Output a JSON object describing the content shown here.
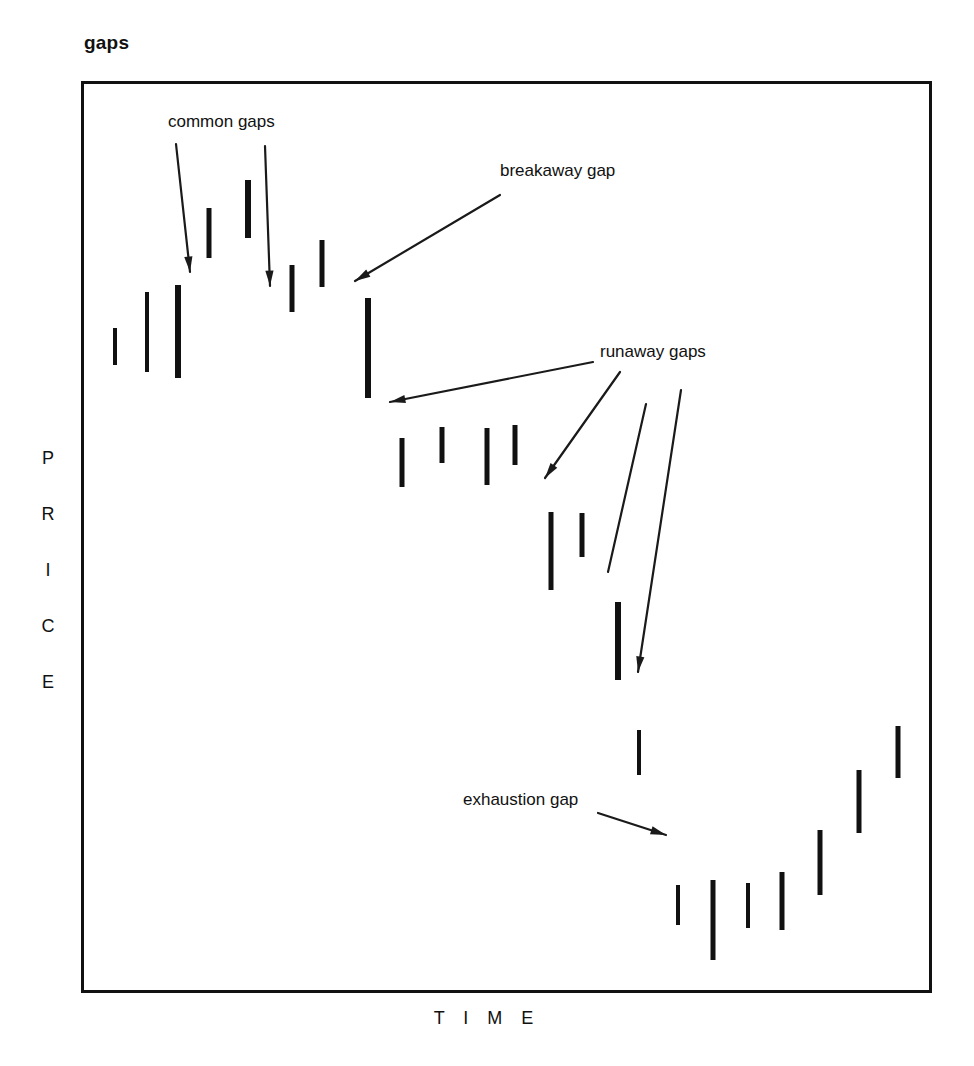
{
  "chart_data": {
    "type": "bar",
    "title": "gaps",
    "xlabel": "T I M E",
    "ylabel": "P R I C E",
    "ylabel_letters": [
      "P",
      "R",
      "I",
      "C",
      "E"
    ],
    "grid": false,
    "legend": null,
    "axis_ranges": {
      "x_pixels": [
        81,
        932
      ],
      "y_pixels": [
        81,
        993
      ]
    },
    "series": [
      {
        "name": "price bars",
        "note": "Each bar is a vertical price-range bar; x is the time position, y_top is the high and y_bottom is the low in pixel space of the plot frame.",
        "bars": [
          {
            "index": 1,
            "x": 115,
            "y_top": 328,
            "y_bottom": 365,
            "width": 4
          },
          {
            "index": 2,
            "x": 147,
            "y_top": 292,
            "y_bottom": 372,
            "width": 4
          },
          {
            "index": 3,
            "x": 178,
            "y_top": 285,
            "y_bottom": 378,
            "width": 6
          },
          {
            "index": 4,
            "x": 209,
            "y_top": 208,
            "y_bottom": 258,
            "width": 5
          },
          {
            "index": 5,
            "x": 248,
            "y_top": 180,
            "y_bottom": 238,
            "width": 6
          },
          {
            "index": 6,
            "x": 292,
            "y_top": 265,
            "y_bottom": 312,
            "width": 5
          },
          {
            "index": 7,
            "x": 322,
            "y_top": 240,
            "y_bottom": 287,
            "width": 5
          },
          {
            "index": 8,
            "x": 368,
            "y_top": 298,
            "y_bottom": 398,
            "width": 6
          },
          {
            "index": 9,
            "x": 402,
            "y_top": 438,
            "y_bottom": 487,
            "width": 5
          },
          {
            "index": 10,
            "x": 442,
            "y_top": 427,
            "y_bottom": 463,
            "width": 5
          },
          {
            "index": 11,
            "x": 487,
            "y_top": 428,
            "y_bottom": 485,
            "width": 5
          },
          {
            "index": 12,
            "x": 515,
            "y_top": 425,
            "y_bottom": 465,
            "width": 5
          },
          {
            "index": 13,
            "x": 551,
            "y_top": 512,
            "y_bottom": 590,
            "width": 5
          },
          {
            "index": 14,
            "x": 582,
            "y_top": 513,
            "y_bottom": 557,
            "width": 5
          },
          {
            "index": 15,
            "x": 618,
            "y_top": 602,
            "y_bottom": 680,
            "width": 6
          },
          {
            "index": 16,
            "x": 639,
            "y_top": 730,
            "y_bottom": 775,
            "width": 4
          },
          {
            "index": 17,
            "x": 678,
            "y_top": 885,
            "y_bottom": 925,
            "width": 4
          },
          {
            "index": 18,
            "x": 713,
            "y_top": 880,
            "y_bottom": 960,
            "width": 5
          },
          {
            "index": 19,
            "x": 748,
            "y_top": 883,
            "y_bottom": 928,
            "width": 4
          },
          {
            "index": 20,
            "x": 782,
            "y_top": 872,
            "y_bottom": 930,
            "width": 5
          },
          {
            "index": 21,
            "x": 820,
            "y_top": 830,
            "y_bottom": 895,
            "width": 5
          },
          {
            "index": 22,
            "x": 859,
            "y_top": 770,
            "y_bottom": 833,
            "width": 5
          },
          {
            "index": 23,
            "x": 898,
            "y_top": 726,
            "y_bottom": 778,
            "width": 5
          }
        ]
      }
    ],
    "annotations": [
      {
        "id": "common-gaps",
        "label": "common gaps",
        "label_x": 168,
        "label_y": 112,
        "arrows": [
          {
            "x1": 176,
            "y1": 144,
            "x2": 190,
            "y2": 272
          },
          {
            "x1": 265,
            "y1": 146,
            "x2": 270,
            "y2": 286
          }
        ]
      },
      {
        "id": "breakaway-gap",
        "label": "breakaway gap",
        "label_x": 500,
        "label_y": 161,
        "arrows": [
          {
            "x1": 500,
            "y1": 195,
            "x2": 355,
            "y2": 281
          }
        ]
      },
      {
        "id": "runaway-gaps",
        "label": "runaway gaps",
        "label_x": 600,
        "label_y": 342,
        "arrows": [
          {
            "x1": 593,
            "y1": 362,
            "x2": 390,
            "y2": 402
          },
          {
            "x1": 620,
            "y1": 372,
            "x2": 545,
            "y2": 478
          },
          {
            "x1": 681,
            "y1": 390,
            "x2": 638,
            "y2": 672
          }
        ],
        "extra_lines": [
          {
            "x1": 646,
            "y1": 404,
            "x2": 608,
            "y2": 572
          }
        ]
      },
      {
        "id": "exhaustion-gap",
        "label": "exhaustion gap",
        "label_x": 463,
        "label_y": 790,
        "arrows": [
          {
            "x1": 598,
            "y1": 813,
            "x2": 666,
            "y2": 835
          }
        ]
      }
    ],
    "colors": {
      "bar": "#111111",
      "frame": "#111111",
      "text": "#111111",
      "annotation": "#1a1a1a",
      "background": "#ffffff"
    }
  }
}
